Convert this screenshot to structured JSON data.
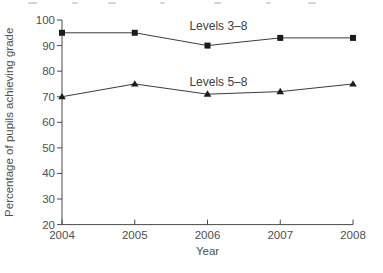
{
  "figure": {
    "background": "#ffffff"
  },
  "chart_data": {
    "type": "line",
    "title": "",
    "xlabel": "Year",
    "ylabel": "Percentage of pupils achieving grade",
    "x": [
      2004,
      2005,
      2006,
      2007,
      2008
    ],
    "x_tick_labels": [
      "2004",
      "2005",
      "2006",
      "2007",
      "2008"
    ],
    "ylim": [
      20,
      100
    ],
    "y_ticks": [
      20,
      30,
      40,
      50,
      60,
      70,
      80,
      90,
      100
    ],
    "grid": false,
    "legend_position": "inline-labels",
    "series": [
      {
        "name": "Levels 3–8",
        "marker": "square",
        "values": [
          95,
          95,
          90,
          93,
          93
        ],
        "label": {
          "x": 2006.15,
          "y": 97.8
        }
      },
      {
        "name": "Levels 5–8",
        "marker": "triangle-up",
        "values": [
          70,
          75,
          71,
          72,
          75
        ],
        "label": {
          "x": 2006.15,
          "y": 75.9
        }
      }
    ],
    "colors": {
      "axis": "#4a4a4a",
      "line": "#3d3d3d",
      "marker": "#1c1c1c",
      "tick_label": "#4f4f4f"
    }
  }
}
